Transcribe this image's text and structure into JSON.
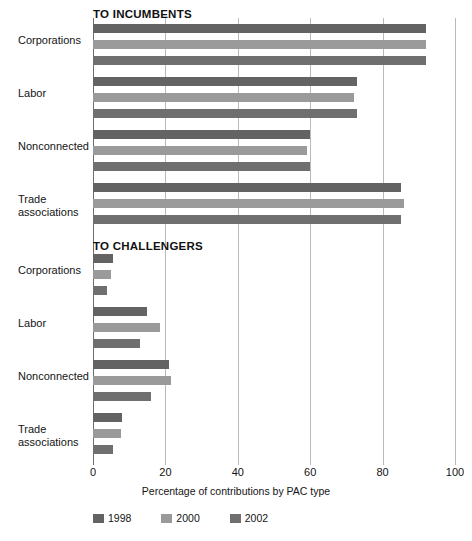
{
  "chart_data": {
    "type": "bar",
    "orientation": "horizontal",
    "title": "",
    "xlabel": "Percentage of contributions by PAC type",
    "ylabel": "",
    "xlim": [
      0,
      100
    ],
    "xticks": [
      0,
      20,
      40,
      60,
      80,
      100
    ],
    "grid": true,
    "legend_position": "bottom",
    "series_names": [
      "1998",
      "2000",
      "2002"
    ],
    "series_colors": [
      "#636363",
      "#9a9a9a",
      "#6f6f6f"
    ],
    "categories": [
      "Corporations",
      "Labor",
      "Nonconnected",
      "Trade\nassociations"
    ],
    "panels": [
      {
        "name": "TO INCUMBENTS",
        "series": [
          {
            "name": "1998",
            "values": [
              92,
              73,
              60,
              85
            ]
          },
          {
            "name": "2000",
            "values": [
              92,
              72,
              59,
              86
            ]
          },
          {
            "name": "2002",
            "values": [
              92,
              73,
              60,
              85
            ]
          }
        ]
      },
      {
        "name": "TO CHALLENGERS",
        "series": [
          {
            "name": "1998",
            "values": [
              5.5,
              15,
              21,
              8
            ]
          },
          {
            "name": "2000",
            "values": [
              5,
              18.5,
              21.5,
              7.7
            ]
          },
          {
            "name": "2002",
            "values": [
              4,
              13,
              16,
              5.5
            ]
          }
        ]
      }
    ]
  },
  "axis": {
    "title": "Percentage of contributions by PAC type",
    "tick_labels": [
      "0",
      "20",
      "40",
      "60",
      "80",
      "100"
    ]
  },
  "panel_titles": {
    "incumbents": "TO INCUMBENTS",
    "challengers": "TO CHALLENGERS"
  },
  "legend": {
    "items": [
      {
        "label": "1998",
        "color": "#636363"
      },
      {
        "label": "2000",
        "color": "#9a9a9a"
      },
      {
        "label": "2002",
        "color": "#6f6f6f"
      }
    ]
  }
}
